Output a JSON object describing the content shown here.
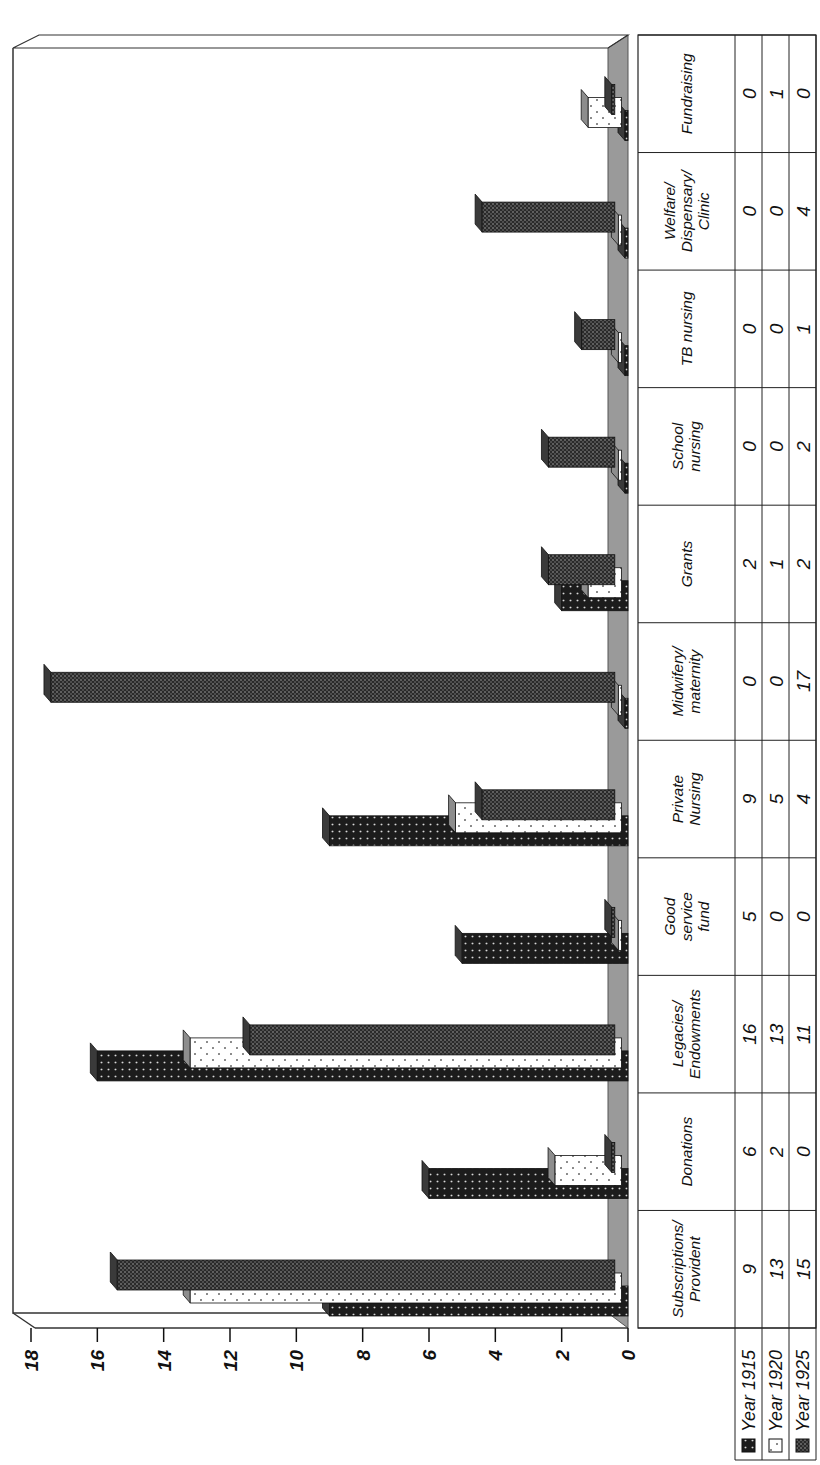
{
  "chart_data": {
    "type": "bar",
    "orientation_note": "3D clustered column chart with data table, page rotated 90 degrees counter-clockwise",
    "title": "",
    "xlabel": "",
    "ylabel": "",
    "ylim": [
      0,
      18
    ],
    "yticks": [
      0,
      2,
      4,
      6,
      8,
      10,
      12,
      14,
      16,
      18
    ],
    "grid": false,
    "legend_position": "data-table-left",
    "categories": [
      "Subscriptions/ Provident",
      "Donations",
      "Legacies/ Endowments",
      "Good service fund",
      "Private Nursing",
      "Midwifery/ maternity",
      "Grants",
      "School nursing",
      "TB nursing",
      "Welfare/ Dispensary/ Clinic",
      "Fundraising"
    ],
    "category_lines": [
      [
        "Subscriptions/",
        "Provident"
      ],
      [
        "Donations"
      ],
      [
        "Legacies/",
        "Endowments"
      ],
      [
        "Good",
        "service",
        "fund"
      ],
      [
        "Private",
        "Nursing"
      ],
      [
        "Midwifery/",
        "maternity"
      ],
      [
        "Grants"
      ],
      [
        "School",
        "nursing"
      ],
      [
        "TB nursing"
      ],
      [
        "Welfare/",
        "Dispensary/",
        "Clinic"
      ],
      [
        "Fundraising"
      ]
    ],
    "series": [
      {
        "name": "Year 1915",
        "pattern": "dark-dotted",
        "color": "#1a1a1a",
        "values": [
          9,
          6,
          16,
          5,
          9,
          0,
          2,
          0,
          0,
          0,
          0
        ]
      },
      {
        "name": "Year 1920",
        "pattern": "white-dotted",
        "color": "#ffffff",
        "values": [
          13,
          2,
          13,
          0,
          5,
          0,
          1,
          0,
          0,
          0,
          1
        ]
      },
      {
        "name": "Year 1925",
        "pattern": "dark-crosshatch-dotted",
        "color": "#333333",
        "values": [
          15,
          0,
          11,
          0,
          4,
          17,
          2,
          2,
          1,
          4,
          0
        ]
      }
    ]
  },
  "colors": {
    "floor": "#9a9a9a",
    "floor_edge": "#555555",
    "frame": "#333333",
    "bar_dark": "#1c1c1c",
    "bar_light": "#ffffff"
  }
}
